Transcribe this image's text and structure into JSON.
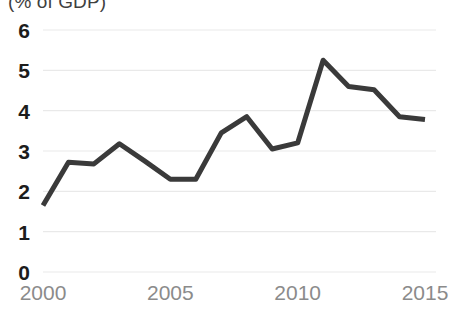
{
  "chart_data": {
    "type": "line",
    "title": "(% of GDP)",
    "xlabel": "",
    "ylabel": "",
    "x": [
      2000,
      2001,
      2002,
      2003,
      2004,
      2005,
      2006,
      2007,
      2008,
      2009,
      2010,
      2011,
      2012,
      2013,
      2014,
      2015
    ],
    "values": [
      1.65,
      2.72,
      2.68,
      3.18,
      2.75,
      2.3,
      2.3,
      3.45,
      3.85,
      3.05,
      3.2,
      5.25,
      4.6,
      4.52,
      3.85,
      3.78
    ],
    "series": [
      {
        "name": "",
        "color": "#3a3a3a",
        "values": [
          1.65,
          2.72,
          2.68,
          3.18,
          2.75,
          2.3,
          2.3,
          3.45,
          3.85,
          3.05,
          3.2,
          5.25,
          4.6,
          4.52,
          3.85,
          3.78
        ]
      }
    ],
    "xlim": [
      2000,
      2015
    ],
    "ylim": [
      0,
      6
    ],
    "y_ticks": [
      0,
      1,
      2,
      3,
      4,
      5,
      6
    ],
    "x_ticks": [
      2000,
      2005,
      2010,
      2015
    ],
    "y_tick_labels": [
      "0",
      "1",
      "2",
      "3",
      "4",
      "5",
      "6"
    ],
    "x_tick_labels": [
      "2000",
      "2005",
      "2010",
      "2015"
    ],
    "grid": true,
    "grid_axis": "y",
    "grid_color": "#e9e9e9",
    "legend": false,
    "legend_position": "none",
    "line_color": "#3a3a3a",
    "line_width": 5,
    "markers": false,
    "background_color": "#ffffff",
    "y_label_color": "#1c1c1c",
    "x_label_color": "#8b8b8b"
  }
}
